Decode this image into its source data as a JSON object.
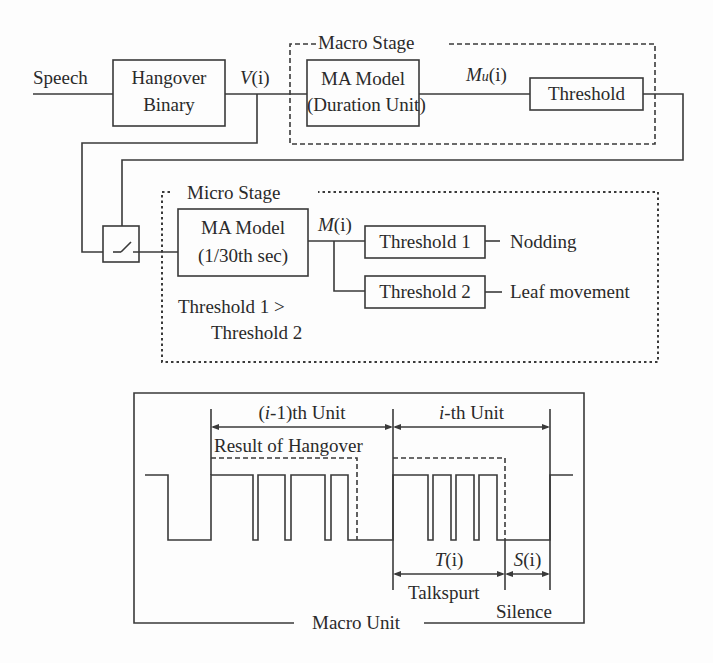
{
  "top_diagram": {
    "input_label": "Speech",
    "hangover_box": {
      "line1": "Hangover",
      "line2": "Binary"
    },
    "v_signal": {
      "name": "V",
      "arg": "(i)"
    },
    "macro_stage": {
      "title": "Macro Stage",
      "ma_model": {
        "line1": "MA Model",
        "line2": "(Duration Unit)"
      },
      "mu_signal": {
        "name": "M",
        "sub": "u",
        "arg": "(i)"
      },
      "threshold": "Threshold"
    },
    "micro_stage": {
      "title": "Micro Stage",
      "ma_model": {
        "line1": "MA Model",
        "line2": "(1/30th sec)"
      },
      "m_signal": {
        "name": "M",
        "arg": "(i)"
      },
      "threshold1": "Threshold 1",
      "threshold2": "Threshold 2",
      "output1": "Nodding",
      "output2": "Leaf movement",
      "note_line1": "Threshold 1  >",
      "note_line2": "Threshold 2"
    },
    "switch_icon": "switch-icon"
  },
  "bottom_diagram": {
    "unit_prev": {
      "prefix": "(",
      "var": "i",
      "suffix": "-1)th Unit"
    },
    "unit_curr": {
      "var": "i",
      "suffix": "-th Unit"
    },
    "hangover_result": "Result of Hangover",
    "talkspurt_var": {
      "name": "T",
      "arg": "(i)"
    },
    "silence_var": {
      "name": "S",
      "arg": "(i)"
    },
    "talkspurt_label": "Talkspurt",
    "silence_label": "Silence",
    "macro_unit_label": "Macro Unit"
  }
}
